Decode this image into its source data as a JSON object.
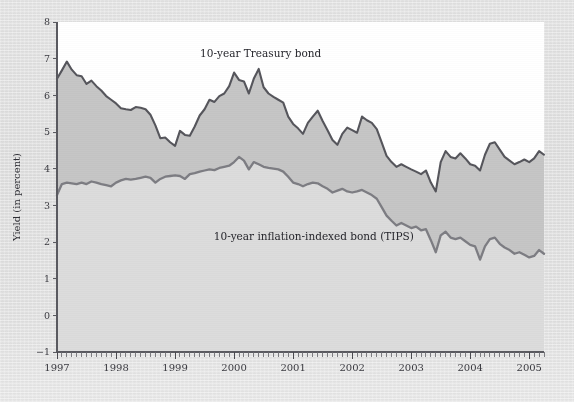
{
  "chart_data": {
    "type": "area",
    "title": "",
    "xlabel": "",
    "ylabel": "Yield (in percent)",
    "ylim": [
      -1,
      8
    ],
    "xlim": [
      1997.0,
      2005.25
    ],
    "grid": false,
    "legend_position": "inline-annotations",
    "y_ticks": [
      "8",
      "7",
      "6",
      "5",
      "4",
      "3",
      "2",
      "1",
      "0",
      "−1"
    ],
    "y_tick_values": [
      8,
      7,
      6,
      5,
      4,
      3,
      2,
      1,
      0,
      -1
    ],
    "x_ticks": [
      "1997",
      "1998",
      "1999",
      "2000",
      "2001",
      "2002",
      "2003",
      "2004",
      "2005"
    ],
    "x_tick_values": [
      1997,
      1998,
      1999,
      2000,
      2001,
      2002,
      2003,
      2004,
      2005
    ],
    "x_minor_tick_interval_months": 1,
    "annotations": [
      {
        "text": "10-year Treasury bond",
        "x": 2000.45,
        "y": 7.05
      },
      {
        "text": "10-year inflation-indexed bond (TIPS)",
        "x": 2001.35,
        "y": 2.05
      }
    ],
    "series": [
      {
        "name": "10-year Treasury bond",
        "color": "#56565c",
        "x": [
          1997.0,
          1997.083,
          1997.167,
          1997.25,
          1997.333,
          1997.417,
          1997.5,
          1997.583,
          1997.667,
          1997.75,
          1997.833,
          1997.917,
          1998.0,
          1998.083,
          1998.167,
          1998.25,
          1998.333,
          1998.417,
          1998.5,
          1998.583,
          1998.667,
          1998.75,
          1998.833,
          1998.917,
          1999.0,
          1999.083,
          1999.167,
          1999.25,
          1999.333,
          1999.417,
          1999.5,
          1999.583,
          1999.667,
          1999.75,
          1999.833,
          1999.917,
          2000.0,
          2000.083,
          2000.167,
          2000.25,
          2000.333,
          2000.417,
          2000.5,
          2000.583,
          2000.667,
          2000.75,
          2000.833,
          2000.917,
          2001.0,
          2001.083,
          2001.167,
          2001.25,
          2001.333,
          2001.417,
          2001.5,
          2001.583,
          2001.667,
          2001.75,
          2001.833,
          2001.917,
          2002.0,
          2002.083,
          2002.167,
          2002.25,
          2002.333,
          2002.417,
          2002.5,
          2002.583,
          2002.667,
          2002.75,
          2002.833,
          2002.917,
          2003.0,
          2003.083,
          2003.167,
          2003.25,
          2003.333,
          2003.417,
          2003.5,
          2003.583,
          2003.667,
          2003.75,
          2003.833,
          2003.917,
          2004.0,
          2004.083,
          2004.167,
          2004.25,
          2004.333,
          2004.417,
          2004.5,
          2004.583,
          2004.667,
          2004.75,
          2004.833,
          2004.917,
          2005.0,
          2005.083,
          2005.167,
          2005.25
        ],
        "values": [
          6.45,
          6.68,
          6.92,
          6.7,
          6.55,
          6.52,
          6.31,
          6.4,
          6.25,
          6.13,
          5.98,
          5.88,
          5.78,
          5.65,
          5.62,
          5.6,
          5.68,
          5.66,
          5.62,
          5.47,
          5.18,
          4.83,
          4.85,
          4.72,
          4.62,
          5.03,
          4.92,
          4.9,
          5.15,
          5.45,
          5.62,
          5.88,
          5.82,
          5.98,
          6.05,
          6.25,
          6.62,
          6.42,
          6.38,
          6.05,
          6.45,
          6.72,
          6.22,
          6.05,
          5.96,
          5.88,
          5.8,
          5.42,
          5.22,
          5.1,
          4.95,
          5.25,
          5.42,
          5.58,
          5.3,
          5.05,
          4.78,
          4.65,
          4.95,
          5.12,
          5.05,
          4.98,
          5.42,
          5.32,
          5.25,
          5.08,
          4.72,
          4.35,
          4.18,
          4.05,
          4.12,
          4.05,
          3.98,
          3.92,
          3.85,
          3.95,
          3.62,
          3.38,
          4.18,
          4.48,
          4.32,
          4.28,
          4.42,
          4.28,
          4.12,
          4.08,
          3.95,
          4.38,
          4.68,
          4.72,
          4.52,
          4.32,
          4.22,
          4.12,
          4.18,
          4.25,
          4.18,
          4.28,
          4.48,
          4.38
        ]
      },
      {
        "name": "10-year inflation-indexed bond (TIPS)",
        "color": "#7d7d83",
        "x": [
          1997.0,
          1997.083,
          1997.167,
          1997.25,
          1997.333,
          1997.417,
          1997.5,
          1997.583,
          1997.667,
          1997.75,
          1997.833,
          1997.917,
          1998.0,
          1998.083,
          1998.167,
          1998.25,
          1998.333,
          1998.417,
          1998.5,
          1998.583,
          1998.667,
          1998.75,
          1998.833,
          1998.917,
          1999.0,
          1999.083,
          1999.167,
          1999.25,
          1999.333,
          1999.417,
          1999.5,
          1999.583,
          1999.667,
          1999.75,
          1999.833,
          1999.917,
          2000.0,
          2000.083,
          2000.167,
          2000.25,
          2000.333,
          2000.417,
          2000.5,
          2000.583,
          2000.667,
          2000.75,
          2000.833,
          2000.917,
          2001.0,
          2001.083,
          2001.167,
          2001.25,
          2001.333,
          2001.417,
          2001.5,
          2001.583,
          2001.667,
          2001.75,
          2001.833,
          2001.917,
          2002.0,
          2002.083,
          2002.167,
          2002.25,
          2002.333,
          2002.417,
          2002.5,
          2002.583,
          2002.667,
          2002.75,
          2002.833,
          2002.917,
          2003.0,
          2003.083,
          2003.167,
          2003.25,
          2003.333,
          2003.417,
          2003.5,
          2003.583,
          2003.667,
          2003.75,
          2003.833,
          2003.917,
          2004.0,
          2004.083,
          2004.167,
          2004.25,
          2004.333,
          2004.417,
          2004.5,
          2004.583,
          2004.667,
          2004.75,
          2004.833,
          2004.917,
          2005.0,
          2005.083,
          2005.167,
          2005.25
        ],
        "values": [
          3.28,
          3.58,
          3.62,
          3.6,
          3.58,
          3.62,
          3.58,
          3.65,
          3.62,
          3.58,
          3.55,
          3.52,
          3.62,
          3.68,
          3.72,
          3.7,
          3.72,
          3.75,
          3.78,
          3.75,
          3.62,
          3.72,
          3.78,
          3.8,
          3.82,
          3.8,
          3.72,
          3.85,
          3.88,
          3.92,
          3.95,
          3.98,
          3.96,
          4.02,
          4.05,
          4.08,
          4.18,
          4.32,
          4.22,
          3.98,
          4.18,
          4.12,
          4.05,
          4.02,
          4.0,
          3.98,
          3.92,
          3.78,
          3.62,
          3.58,
          3.52,
          3.58,
          3.62,
          3.6,
          3.52,
          3.45,
          3.35,
          3.4,
          3.45,
          3.38,
          3.35,
          3.38,
          3.42,
          3.35,
          3.28,
          3.18,
          2.95,
          2.72,
          2.58,
          2.45,
          2.52,
          2.45,
          2.38,
          2.42,
          2.32,
          2.35,
          2.05,
          1.72,
          2.18,
          2.28,
          2.12,
          2.08,
          2.12,
          2.02,
          1.92,
          1.88,
          1.52,
          1.88,
          2.08,
          2.12,
          1.95,
          1.85,
          1.78,
          1.68,
          1.72,
          1.65,
          1.58,
          1.62,
          1.78,
          1.68
        ]
      }
    ]
  },
  "axis": {
    "y_title": "Yield (in percent)"
  }
}
